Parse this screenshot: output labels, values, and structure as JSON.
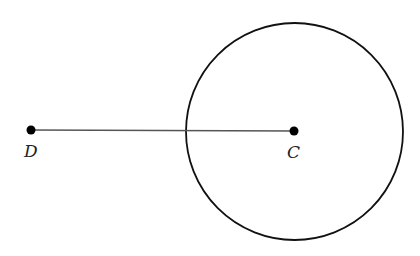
{
  "diagram": {
    "points": [
      {
        "id": "D",
        "label": "D",
        "x": 31,
        "y": 130
      },
      {
        "id": "C",
        "label": "C",
        "x": 294,
        "y": 131
      }
    ],
    "segment": {
      "from": "D",
      "to": "C"
    },
    "circle": {
      "center": "C",
      "cx": 294,
      "cy": 131,
      "r": 109
    },
    "colors": {
      "stroke": "#111111",
      "segment": "#444444",
      "background": "#ffffff"
    }
  }
}
